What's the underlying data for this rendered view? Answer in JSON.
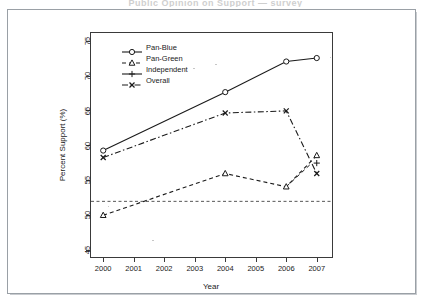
{
  "figure": {
    "scan_title_fragment": "Public Opinion on Support  —  survey",
    "axis_x_label": "Year",
    "axis_y_label": "Percent Support (%)"
  },
  "legend": {
    "position": "top-left-inside",
    "entries": [
      {
        "label": "Pan-Blue",
        "marker": "circle",
        "line": "solid"
      },
      {
        "label": "Pan-Green",
        "marker": "triangle",
        "line": "dashed"
      },
      {
        "label": "Independent",
        "marker": "plus",
        "line": "solid"
      },
      {
        "label": "Overall",
        "marker": "cross",
        "line": "dashdot"
      }
    ]
  },
  "chart_data": {
    "type": "line",
    "title": "",
    "xlabel": "Year",
    "ylabel": "Percent Support (%)",
    "xlim": [
      1999.6,
      2007.5
    ],
    "ylim": [
      44.0,
      76.2
    ],
    "xticks": [
      2000,
      2001,
      2002,
      2003,
      2004,
      2005,
      2006,
      2007
    ],
    "yticks": [
      45,
      50,
      55,
      60,
      65,
      70,
      75
    ],
    "grid": false,
    "reference_line": {
      "y": 52.0,
      "style": "dashed",
      "color": "#444444"
    },
    "series": [
      {
        "name": "Pan-Blue",
        "marker": "circle",
        "line": "solid",
        "color": "#1a1a1a",
        "x": [
          2000,
          2004,
          2006,
          2007
        ],
        "values": [
          59.3,
          67.7,
          72.1,
          72.6
        ]
      },
      {
        "name": "Pan-Green",
        "marker": "triangle",
        "line": "dashed",
        "color": "#1a1a1a",
        "x": [
          2000,
          2004,
          2006,
          2007
        ],
        "values": [
          50.0,
          56.0,
          54.1,
          58.6
        ]
      },
      {
        "name": "Independent",
        "marker": "plus",
        "line": "solid",
        "color": "#1a1a1a",
        "x": [
          2007
        ],
        "values": [
          57.5
        ]
      },
      {
        "name": "Overall",
        "marker": "cross",
        "line": "dashdot",
        "color": "#1a1a1a",
        "x": [
          2000,
          2004,
          2006,
          2007
        ],
        "values": [
          58.3,
          64.7,
          65.0,
          56.0
        ]
      }
    ]
  }
}
